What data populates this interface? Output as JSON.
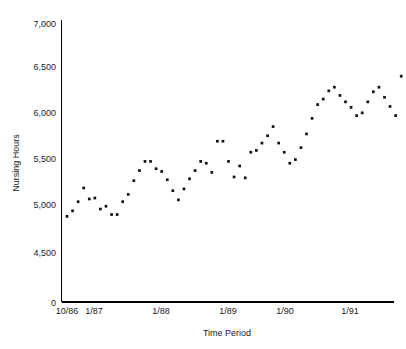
{
  "chart_data": {
    "type": "scatter",
    "title": "",
    "xlabel": "Time Period",
    "ylabel": "Nursing Hours",
    "ylim": [
      0,
      7000
    ],
    "y_break_after": 0,
    "grid": false,
    "legend": null,
    "marker": "square",
    "marker_color": "#111111",
    "y_ticks": [
      0,
      4500,
      5000,
      5500,
      6000,
      6500,
      7000
    ],
    "y_tick_labels": [
      "0",
      "4,500",
      "5,000",
      "5,500",
      "6,000",
      "6,500",
      "7,000"
    ],
    "x_ticks": [
      "10/86",
      "1/87",
      "1/88",
      "1/89",
      "1/90",
      "1/91"
    ],
    "x_tick_labels": [
      "10/86",
      "1/87",
      "1/88",
      "1/89",
      "1/90",
      "1/91"
    ],
    "x": [
      "10/86",
      "11/86",
      "12/86",
      "1/87",
      "2/87",
      "3/87",
      "4/87",
      "5/87",
      "6/87",
      "7/87",
      "8/87",
      "9/87",
      "10/87",
      "11/87",
      "12/87",
      "1/88",
      "2/88",
      "3/88",
      "4/88",
      "5/88",
      "6/88",
      "7/88",
      "8/88",
      "9/88",
      "10/88",
      "11/88",
      "12/88",
      "1/89",
      "2/89",
      "3/89",
      "4/89",
      "5/89",
      "6/89",
      "7/89",
      "8/89",
      "9/89",
      "10/89",
      "11/89",
      "12/89",
      "1/90",
      "2/90",
      "3/90",
      "4/90",
      "5/90",
      "6/90",
      "7/90",
      "8/90",
      "9/90",
      "10/90",
      "11/90",
      "12/90",
      "1/91",
      "2/91",
      "3/91",
      "4/91",
      "5/91",
      "6/91",
      "7/91",
      "8/91",
      "9/91",
      "10/91"
    ],
    "values": [
      4900,
      4960,
      5060,
      5210,
      5090,
      5100,
      4980,
      5010,
      4920,
      4920,
      5060,
      5140,
      5290,
      5400,
      5500,
      5500,
      5420,
      5390,
      5300,
      5180,
      5080,
      5200,
      5310,
      5400,
      5500,
      5480,
      5380,
      5720,
      5720,
      5500,
      5330,
      5450,
      5320,
      5600,
      5620,
      5700,
      5780,
      5880,
      5700,
      5600,
      5480,
      5520,
      5650,
      5800,
      5970,
      6120,
      6180,
      6270,
      6310,
      6220,
      6150,
      6090,
      6000,
      6030,
      6150,
      6260,
      6310,
      6200,
      6100,
      6000,
      6430
    ],
    "series_name": "Nursing Hours",
    "n_points": 61
  },
  "axes": {
    "y_axis_label": "Nursing Hours",
    "x_axis_label": "Time Period"
  }
}
